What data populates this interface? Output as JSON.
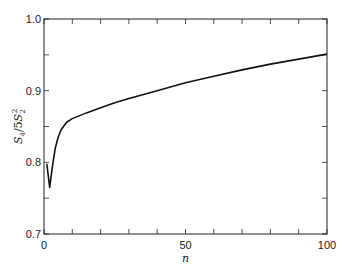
{
  "chart_data": {
    "type": "line",
    "title": "",
    "xlabel": "n",
    "ylabel": "S4/5S2^2",
    "ylabel_parts": {
      "s1": "S",
      "sub1": "4",
      "mid": "/5",
      "s2": "S",
      "sub2": "2",
      "sup2": "2"
    },
    "xlim": [
      0,
      100
    ],
    "ylim": [
      0.7,
      1.0
    ],
    "x_ticks": [
      0,
      50,
      100
    ],
    "x_tick_labels": [
      "0",
      "50",
      "100"
    ],
    "x_minor_step": 10,
    "y_ticks": [
      0.7,
      0.8,
      0.9,
      1.0
    ],
    "y_tick_labels": [
      "0.7",
      "0.8",
      "0.9",
      "1.0"
    ],
    "y_minor_step": 0.05,
    "grid": false,
    "series": [
      {
        "name": "S4/5S2^2",
        "x": [
          1,
          2,
          3,
          4,
          5,
          6,
          8,
          10,
          15,
          20,
          25,
          30,
          40,
          50,
          60,
          70,
          80,
          90,
          100
        ],
        "y": [
          0.798,
          0.765,
          0.795,
          0.82,
          0.835,
          0.845,
          0.856,
          0.861,
          0.869,
          0.876,
          0.883,
          0.889,
          0.9,
          0.911,
          0.92,
          0.929,
          0.937,
          0.944,
          0.951
        ]
      }
    ]
  }
}
